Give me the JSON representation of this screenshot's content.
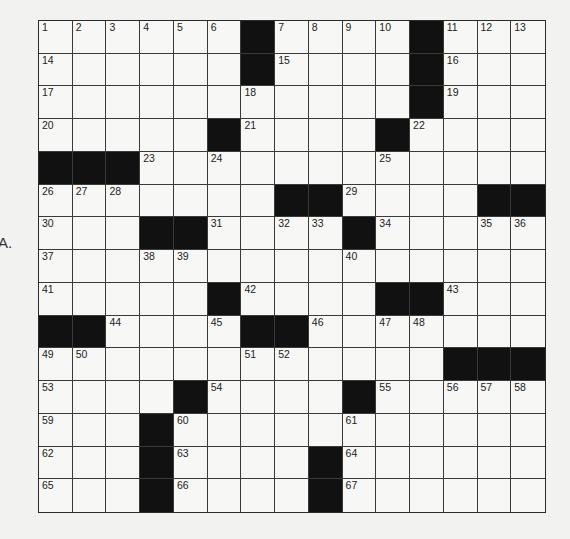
{
  "side_label": "A.",
  "puzzle": {
    "rows": 15,
    "cols": 15,
    "grid": [
      [
        "1",
        "2",
        "3",
        "4",
        "5",
        "6",
        "#",
        "7",
        "8",
        "9",
        "10",
        "#",
        "11",
        "12",
        "13"
      ],
      [
        "14",
        "",
        "",
        "",
        "",
        "",
        "#",
        "15",
        "",
        "",
        "",
        "#",
        "16",
        "",
        ""
      ],
      [
        "17",
        "",
        "",
        "",
        "",
        "",
        "18",
        "",
        "",
        "",
        "",
        "#",
        "19",
        "",
        ""
      ],
      [
        "20",
        "",
        "",
        "",
        "",
        "#",
        "21",
        "",
        "",
        "",
        "#",
        "22",
        "",
        "",
        ""
      ],
      [
        "#",
        "#",
        "#",
        "23",
        "",
        "24",
        "",
        "",
        "",
        "",
        "25",
        "",
        "",
        "",
        ""
      ],
      [
        "26",
        "27",
        "28",
        "",
        "",
        "",
        "",
        "#",
        "#",
        "29",
        "",
        "",
        "",
        "#",
        "#"
      ],
      [
        "30",
        "",
        "",
        "#",
        "#",
        "31",
        "",
        "32",
        "33",
        "#",
        "34",
        "",
        "",
        "35",
        "36"
      ],
      [
        "37",
        "",
        "",
        "38",
        "39",
        "",
        "",
        "",
        "",
        "40",
        "",
        "",
        "",
        "",
        ""
      ],
      [
        "41",
        "",
        "",
        "",
        "",
        "#",
        "42",
        "",
        "",
        "",
        "#",
        "#",
        "43",
        "",
        ""
      ],
      [
        "#",
        "#",
        "44",
        "",
        "",
        "45",
        "#",
        "#",
        "46",
        "",
        "47",
        "48",
        "",
        "",
        ""
      ],
      [
        "49",
        "50",
        "",
        "",
        "",
        "",
        "51",
        "52",
        "",
        "",
        "",
        "",
        "#",
        "#",
        "#"
      ],
      [
        "53",
        "",
        "",
        "",
        "#",
        "54",
        "",
        "",
        "",
        "#",
        "55",
        "",
        "56",
        "57",
        "58"
      ],
      [
        "59",
        "",
        "",
        "#",
        "60",
        "",
        "",
        "",
        "",
        "61",
        "",
        "",
        "",
        "",
        ""
      ],
      [
        "62",
        "",
        "",
        "#",
        "63",
        "",
        "",
        "",
        "#",
        "64",
        "",
        "",
        "",
        "",
        ""
      ],
      [
        "65",
        "",
        "",
        "#",
        "66",
        "",
        "",
        "",
        "#",
        "67",
        "",
        "",
        "",
        "",
        ""
      ]
    ]
  }
}
